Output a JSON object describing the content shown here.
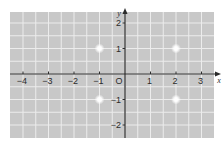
{
  "diagram": {
    "type": "coordinate-plane",
    "colors": {
      "background": "#ffffff",
      "grid_fill": "#c8c8c8",
      "grid_line": "#ececec",
      "axis": "#2b2b2b",
      "point": "#ffffff"
    },
    "axes": {
      "x_label": "x",
      "y_label": "y",
      "origin_label": "O",
      "x_ticks": [
        {
          "value": -4,
          "label": "−4"
        },
        {
          "value": -3,
          "label": "−3"
        },
        {
          "value": -2,
          "label": "−2"
        },
        {
          "value": -1,
          "label": "−1"
        },
        {
          "value": 1,
          "label": "1"
        },
        {
          "value": 2,
          "label": "2"
        },
        {
          "value": 3,
          "label": "3"
        }
      ],
      "y_ticks": [
        {
          "value": 2,
          "label": "2"
        },
        {
          "value": 1,
          "label": "1"
        },
        {
          "value": -1,
          "label": "−1"
        },
        {
          "value": -2,
          "label": "−2"
        }
      ],
      "x_range": [
        -4.5,
        3.5
      ],
      "y_range": [
        -2.5,
        2.4
      ],
      "grid_step": 0.5
    },
    "points": [
      {
        "x": -1,
        "y": 1
      },
      {
        "x": 2,
        "y": 1
      },
      {
        "x": -1,
        "y": -1
      },
      {
        "x": 2,
        "y": -1
      }
    ]
  }
}
